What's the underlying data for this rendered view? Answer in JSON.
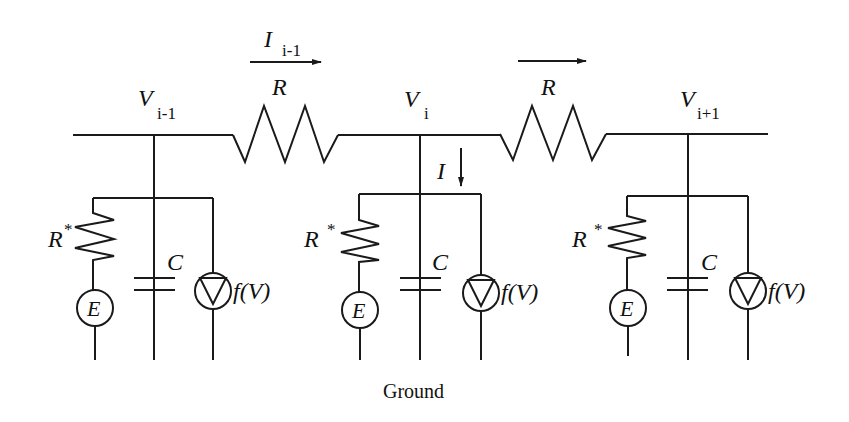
{
  "diagram": {
    "type": "circuit",
    "stroke_color": "#1a1a1a",
    "background": "#ffffff"
  },
  "nodes": [
    {
      "id": "left",
      "voltage_symbol": "V",
      "voltage_sub": "i-1"
    },
    {
      "id": "middle",
      "voltage_symbol": "V",
      "voltage_sub": "i"
    },
    {
      "id": "right",
      "voltage_symbol": "V",
      "voltage_sub": "i+1"
    }
  ],
  "series_resistors": [
    {
      "label": "R",
      "current_symbol": "I",
      "current_sub": "i-1"
    },
    {
      "label": "R",
      "current_symbol": "",
      "current_sub": ""
    }
  ],
  "shunt": {
    "current_label": "I",
    "resistor_label": "R",
    "resistor_superscript": "*",
    "capacitor_label": "C",
    "battery_label": "E",
    "source_label": "f(V)"
  },
  "ground_label": "Ground"
}
